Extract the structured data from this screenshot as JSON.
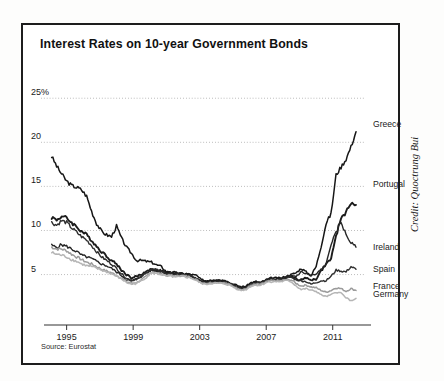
{
  "figure": {
    "title": "Interest Rates on 10-year Government Bonds",
    "source_note": "Source: Eurostat",
    "credit": "Credit: Quoctrung Bui",
    "frame_color": "#1d1d1d",
    "background_color": "#ffffff"
  },
  "chart_data": {
    "type": "line",
    "title": "Interest Rates on 10-year Government Bonds",
    "xlabel": "",
    "ylabel": "",
    "xlim": [
      1994.0,
      2012.7
    ],
    "ylim": [
      2.0,
      26.5
    ],
    "xticks": [
      1995,
      1999,
      2003,
      2007,
      2011
    ],
    "xticklabels": [
      "1995",
      "1999",
      "2003",
      "2007",
      "2011"
    ],
    "yticks": [
      5,
      10,
      15,
      20,
      25
    ],
    "yticklabels": [
      "5",
      "10",
      "15",
      "20",
      "25%"
    ],
    "grid": "horizontal-dotted",
    "legend": "right-of-line-ends",
    "x": [
      1994.1,
      1994.4,
      1994.7,
      1995.0,
      1995.3,
      1995.6,
      1995.9,
      1996.2,
      1996.5,
      1996.8,
      1997.1,
      1997.4,
      1997.7,
      1998.0,
      1998.3,
      1998.6,
      1998.9,
      1999.2,
      1999.5,
      1999.8,
      2000.1,
      2000.4,
      2000.7,
      2001.0,
      2001.3,
      2001.6,
      2001.9,
      2002.2,
      2002.5,
      2002.8,
      2003.1,
      2003.4,
      2003.7,
      2004.0,
      2004.3,
      2004.6,
      2004.9,
      2005.2,
      2005.5,
      2005.8,
      2006.1,
      2006.4,
      2006.7,
      2007.0,
      2007.3,
      2007.6,
      2007.9,
      2008.2,
      2008.5,
      2008.8,
      2009.1,
      2009.4,
      2009.7,
      2010.0,
      2010.3,
      2010.6,
      2010.9,
      2011.2,
      2011.5,
      2011.8,
      2012.1,
      2012.4
    ],
    "series": [
      {
        "name": "Greece",
        "color": "#161616",
        "width": 1.5,
        "label_y_value": 22.0,
        "values": [
          18.4,
          17.3,
          16.4,
          15.6,
          15.1,
          14.9,
          14.6,
          13.9,
          12.2,
          10.8,
          9.9,
          9.5,
          9.3,
          10.5,
          9.1,
          8.1,
          7.4,
          6.6,
          6.6,
          6.5,
          6.4,
          6.1,
          5.9,
          5.3,
          5.3,
          5.2,
          5.1,
          5.1,
          5.0,
          4.9,
          4.4,
          4.3,
          4.4,
          4.4,
          4.4,
          4.2,
          4.0,
          3.8,
          3.6,
          3.7,
          4.1,
          4.2,
          4.1,
          4.4,
          4.6,
          4.6,
          4.6,
          4.8,
          5.0,
          5.2,
          5.7,
          5.3,
          4.9,
          5.9,
          8.2,
          10.8,
          11.9,
          16.3,
          17.2,
          18.1,
          19.5,
          21.2
        ]
      },
      {
        "name": "Portugal",
        "color": "#1c1c1c",
        "width": 1.9,
        "label_y_value": 15.2,
        "values": [
          11.5,
          11.2,
          11.6,
          11.4,
          10.9,
          10.4,
          9.9,
          9.5,
          8.9,
          8.2,
          7.6,
          7.1,
          6.6,
          6.2,
          5.5,
          5.0,
          4.6,
          4.8,
          5.0,
          5.4,
          5.6,
          5.5,
          5.4,
          5.2,
          5.2,
          5.1,
          5.1,
          5.0,
          4.9,
          4.5,
          4.2,
          4.2,
          4.3,
          4.3,
          4.3,
          4.2,
          3.9,
          3.7,
          3.5,
          3.6,
          4.0,
          4.1,
          4.1,
          4.4,
          4.5,
          4.5,
          4.5,
          4.6,
          4.8,
          4.5,
          4.4,
          4.6,
          4.4,
          4.5,
          5.4,
          6.2,
          6.8,
          9.3,
          11.5,
          12.0,
          13.2,
          12.9
        ]
      },
      {
        "name": "Ireland",
        "color": "#262626",
        "width": 1.4,
        "label_y_value": 8.0,
        "values": [
          8.3,
          8.1,
          8.4,
          8.2,
          7.9,
          7.6,
          7.2,
          7.0,
          6.8,
          6.5,
          6.2,
          6.0,
          5.7,
          5.3,
          4.9,
          4.4,
          4.3,
          4.5,
          4.8,
          5.2,
          5.5,
          5.4,
          5.3,
          5.1,
          5.1,
          5.0,
          5.0,
          4.9,
          4.8,
          4.5,
          4.2,
          4.1,
          4.2,
          4.2,
          4.2,
          4.1,
          3.9,
          3.6,
          3.4,
          3.5,
          3.9,
          4.0,
          4.0,
          4.3,
          4.4,
          4.4,
          4.5,
          4.7,
          4.9,
          4.8,
          5.3,
          5.1,
          4.9,
          5.0,
          5.6,
          6.1,
          8.5,
          9.7,
          11.0,
          9.5,
          8.6,
          8.1
        ]
      },
      {
        "name": "Spain",
        "color": "#2e2e2e",
        "width": 1.4,
        "label_y_value": 5.5,
        "values": [
          10.9,
          10.6,
          11.1,
          10.9,
          10.3,
          9.8,
          9.3,
          8.9,
          8.3,
          7.6,
          7.0,
          6.6,
          6.2,
          5.7,
          5.1,
          4.6,
          4.3,
          4.5,
          4.8,
          5.2,
          5.6,
          5.5,
          5.4,
          5.1,
          5.1,
          5.0,
          5.0,
          4.9,
          4.8,
          4.5,
          4.2,
          4.1,
          4.2,
          4.2,
          4.2,
          4.1,
          3.9,
          3.6,
          3.4,
          3.5,
          3.9,
          4.0,
          4.0,
          4.3,
          4.4,
          4.4,
          4.4,
          4.6,
          4.7,
          4.4,
          4.3,
          4.2,
          3.9,
          4.1,
          4.3,
          4.3,
          4.8,
          5.5,
          5.4,
          5.3,
          5.9,
          5.6
        ]
      },
      {
        "name": "France",
        "color": "#9b9b9b",
        "width": 1.5,
        "label_y_value": 3.6,
        "values": [
          8.1,
          7.9,
          7.9,
          7.7,
          7.3,
          7.0,
          6.7,
          6.4,
          6.2,
          5.9,
          5.6,
          5.4,
          5.2,
          4.9,
          4.6,
          4.2,
          4.0,
          4.1,
          4.4,
          4.8,
          5.3,
          5.2,
          5.1,
          4.9,
          4.9,
          4.8,
          4.9,
          4.8,
          4.7,
          4.4,
          4.1,
          4.0,
          4.1,
          4.1,
          4.1,
          4.0,
          3.8,
          3.5,
          3.3,
          3.4,
          3.8,
          3.9,
          3.9,
          4.2,
          4.3,
          4.3,
          4.3,
          4.4,
          4.4,
          4.0,
          3.7,
          3.8,
          3.6,
          3.5,
          3.2,
          3.0,
          3.2,
          3.5,
          3.4,
          3.1,
          3.4,
          3.2
        ]
      },
      {
        "name": "Germany",
        "color": "#b5b5b5",
        "width": 1.5,
        "label_y_value": 2.7,
        "values": [
          7.5,
          7.3,
          7.2,
          7.0,
          6.7,
          6.5,
          6.2,
          6.0,
          5.9,
          5.7,
          5.5,
          5.3,
          5.1,
          4.8,
          4.5,
          4.1,
          3.9,
          4.0,
          4.3,
          4.7,
          5.2,
          5.1,
          5.0,
          4.8,
          4.8,
          4.7,
          4.8,
          4.7,
          4.6,
          4.3,
          4.0,
          3.9,
          4.0,
          4.0,
          4.0,
          3.9,
          3.7,
          3.4,
          3.2,
          3.3,
          3.7,
          3.8,
          3.8,
          4.1,
          4.2,
          4.2,
          4.2,
          4.3,
          4.2,
          3.7,
          3.3,
          3.4,
          3.2,
          3.1,
          2.7,
          2.5,
          2.7,
          3.0,
          2.9,
          2.4,
          2.0,
          2.3
        ]
      }
    ]
  }
}
